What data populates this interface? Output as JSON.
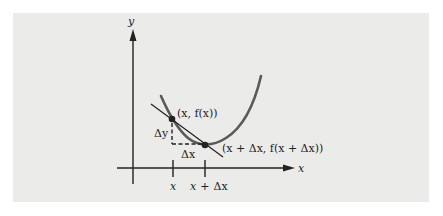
{
  "figure": {
    "background_color": "#ebebea",
    "curve_color": "#5a5a5a",
    "line_color": "#222222",
    "axes": {
      "x_label": "x",
      "y_label": "y"
    },
    "ticks": [
      {
        "label": "x"
      },
      {
        "label_parts": [
          "x",
          "+",
          "Δx"
        ]
      }
    ],
    "points": [
      {
        "label": "(x, f(x))"
      },
      {
        "label": "(x + Δx, f(x + Δx))"
      }
    ],
    "increments": {
      "dy": "Δy",
      "dx": "Δx"
    }
  }
}
